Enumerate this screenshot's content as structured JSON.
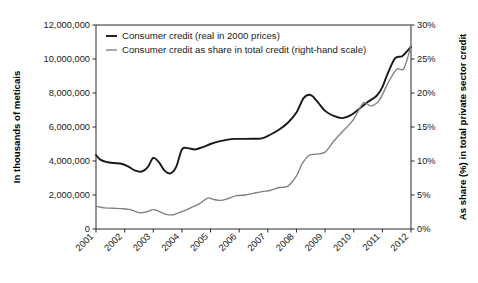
{
  "chart_data": {
    "type": "line",
    "title": "",
    "xlabel": "",
    "ylabel": "In thousands of meticais",
    "ylabel_right": "As share (%) in total private sector credit",
    "grid": false,
    "legend_position": "top-left",
    "xlim": [
      2001,
      2012
    ],
    "ylim": [
      0,
      12000000
    ],
    "ylim_right": [
      0,
      30
    ],
    "x_tick_labels": [
      "2001",
      "2002",
      "2003",
      "2004",
      "2005",
      "2006",
      "2007",
      "2008",
      "2009",
      "2010",
      "2011",
      "2012"
    ],
    "y_tick_labels": [
      "0",
      "2,000,000",
      "4,000,000",
      "6,000,000",
      "8,000,000",
      "10,000,000",
      "12,000,000"
    ],
    "y_tick_values": [
      0,
      2000000,
      4000000,
      6000000,
      8000000,
      10000000,
      12000000
    ],
    "y_right_tick_labels": [
      "0%",
      "5%",
      "10%",
      "15%",
      "20%",
      "25%",
      "30%"
    ],
    "y_right_tick_values": [
      0,
      5,
      10,
      15,
      20,
      25,
      30
    ],
    "series": [
      {
        "name": "Consumer credit (real in 2000 prices)",
        "axis": "left",
        "color": "#17181a",
        "x": [
          2001.0,
          2001.15,
          2001.35,
          2001.6,
          2001.85,
          2002.1,
          2002.35,
          2002.6,
          2002.8,
          2003.0,
          2003.2,
          2003.4,
          2003.6,
          2003.8,
          2004.0,
          2004.2,
          2004.45,
          2004.7,
          2005.0,
          2005.3,
          2005.6,
          2005.9,
          2006.2,
          2006.5,
          2006.8,
          2007.1,
          2007.4,
          2007.7,
          2008.0,
          2008.25,
          2008.5,
          2008.75,
          2009.0,
          2009.3,
          2009.6,
          2009.9,
          2010.2,
          2010.5,
          2010.8,
          2011.0,
          2011.2,
          2011.45,
          2011.7,
          2012.0
        ],
        "y": [
          4350000,
          4080000,
          3950000,
          3880000,
          3850000,
          3700000,
          3450000,
          3380000,
          3620000,
          4180000,
          3920000,
          3420000,
          3270000,
          3650000,
          4680000,
          4760000,
          4680000,
          4800000,
          5000000,
          5150000,
          5260000,
          5300000,
          5300000,
          5310000,
          5330000,
          5560000,
          5850000,
          6250000,
          6850000,
          7700000,
          7880000,
          7450000,
          6950000,
          6650000,
          6520000,
          6700000,
          7080000,
          7480000,
          7840000,
          8350000,
          9200000,
          10050000,
          10180000,
          10720000
        ]
      },
      {
        "name": "Consumer credit as share in total credit (right-hand scale)",
        "axis": "right",
        "color": "#7d8186",
        "x": [
          2001.0,
          2001.3,
          2001.6,
          2001.9,
          2002.2,
          2002.5,
          2002.75,
          2003.0,
          2003.2,
          2003.45,
          2003.7,
          2004.0,
          2004.3,
          2004.6,
          2004.9,
          2005.1,
          2005.35,
          2005.6,
          2005.9,
          2006.2,
          2006.5,
          2006.8,
          2007.1,
          2007.4,
          2007.7,
          2008.0,
          2008.2,
          2008.45,
          2008.7,
          2009.0,
          2009.3,
          2009.6,
          2009.9,
          2010.1,
          2010.35,
          2010.6,
          2010.9,
          2011.2,
          2011.5,
          2011.75,
          2012.0
        ],
        "y": [
          3.35,
          3.1,
          3.05,
          3.0,
          2.85,
          2.4,
          2.5,
          2.85,
          2.6,
          2.15,
          2.1,
          2.55,
          3.1,
          3.7,
          4.55,
          4.35,
          4.2,
          4.45,
          4.9,
          5.0,
          5.25,
          5.5,
          5.7,
          6.1,
          6.3,
          7.8,
          9.6,
          10.85,
          11.0,
          11.3,
          12.9,
          14.3,
          15.6,
          16.9,
          18.6,
          18.1,
          19.0,
          21.5,
          23.5,
          23.6,
          26.9
        ]
      }
    ],
    "legend": [
      {
        "label": "Consumer credit (real in 2000 prices)",
        "color": "#17181a"
      },
      {
        "label": "Consumer credit as share in total credit (right-hand scale)",
        "color": "#7d8186"
      }
    ]
  }
}
